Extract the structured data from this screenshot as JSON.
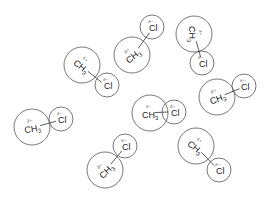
{
  "diagram": {
    "title": "",
    "colors": {
      "stroke": "#555555",
      "text": "#222222",
      "background": "#ffffff"
    },
    "labels": {
      "methyl": "CH",
      "methyl_sub": "3",
      "chlorine": "Cl",
      "delta_plus": "δ+",
      "delta_minus": "δ−"
    },
    "molecules": [
      {
        "id": "A",
        "ch3": [
          82,
          65
        ],
        "cl": [
          107,
          85
        ],
        "junction": [
          95,
          79
        ],
        "ch3_rot": 40
      },
      {
        "id": "B",
        "ch3": [
          132,
          55
        ],
        "cl": [
          152,
          27
        ],
        "junction": [
          146,
          40
        ],
        "ch3_rot": -40
      },
      {
        "id": "C",
        "ch3": [
          194,
          34
        ],
        "cl": [
          202,
          63
        ],
        "junction": [
          199,
          50
        ],
        "ch3_rot": 90
      },
      {
        "id": "D",
        "ch3": [
          217,
          97
        ],
        "cl": [
          244,
          86
        ],
        "junction": [
          234,
          92
        ],
        "ch3_rot": -20
      },
      {
        "id": "E",
        "ch3": [
          150,
          113
        ],
        "cl": [
          174,
          112
        ],
        "junction": [
          161,
          112
        ],
        "ch3_rot": 0
      },
      {
        "id": "F",
        "ch3": [
          32,
          127
        ],
        "cl": [
          61,
          119
        ],
        "junction": [
          50,
          124
        ],
        "ch3_rot": -10
      },
      {
        "id": "G",
        "ch3": [
          105,
          170
        ],
        "cl": [
          125,
          146
        ],
        "junction": [
          118,
          157
        ],
        "ch3_rot": -45
      },
      {
        "id": "H",
        "ch3": [
          196,
          146
        ],
        "cl": [
          219,
          170
        ],
        "junction": [
          208,
          160
        ],
        "ch3_rot": 40
      }
    ]
  }
}
